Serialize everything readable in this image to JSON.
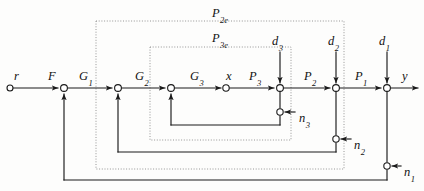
{
  "figure": {
    "type": "control-system-block-diagram",
    "title": "",
    "width": 424,
    "height": 191,
    "background_color": "#fdfdfc",
    "line_color": "#1a1a1a",
    "dotted_box_color": "#8a8a8a"
  },
  "signals": {
    "reference_input": {
      "base": "r",
      "sub": "",
      "x": 14,
      "y": 70
    },
    "output": {
      "base": "y",
      "sub": "",
      "x": 402,
      "y": 70
    },
    "intermediate": {
      "base": "x",
      "sub": "",
      "x": 226,
      "y": 70
    }
  },
  "blocks": [
    {
      "base": "F",
      "sub": "",
      "x": 48,
      "y": 70
    },
    {
      "base": "G",
      "sub": "1",
      "x": 79,
      "y": 70
    },
    {
      "base": "G",
      "sub": "2",
      "x": 135,
      "y": 70
    },
    {
      "base": "G",
      "sub": "3",
      "x": 190,
      "y": 70
    },
    {
      "base": "P",
      "sub": "3",
      "x": 249,
      "y": 70
    },
    {
      "base": "P",
      "sub": "2",
      "x": 304,
      "y": 70
    },
    {
      "base": "P",
      "sub": "1",
      "x": 355,
      "y": 70
    }
  ],
  "disturbances": [
    {
      "base": "d",
      "sub": "3",
      "x": 272,
      "y": 35,
      "inject_x": 280,
      "inject_y": 88
    },
    {
      "base": "d",
      "sub": "2",
      "x": 328,
      "y": 35,
      "inject_x": 336,
      "inject_y": 88
    },
    {
      "base": "d",
      "sub": "1",
      "x": 379,
      "y": 35,
      "inject_x": 387,
      "inject_y": 88
    }
  ],
  "noises": [
    {
      "base": "n",
      "sub": "3",
      "x": 299,
      "y": 112,
      "node_x": 280,
      "node_y": 112
    },
    {
      "base": "n",
      "sub": "2",
      "x": 354,
      "y": 139,
      "node_x": 336,
      "node_y": 139
    },
    {
      "base": "n",
      "sub": "1",
      "x": 404,
      "y": 166,
      "node_x": 387,
      "node_y": 166
    }
  ],
  "plant_boundaries": [
    {
      "base": "P",
      "sub": "2e",
      "label_x": 212,
      "label_y": 7,
      "box": {
        "x": 96,
        "y": 21,
        "width": 248,
        "height": 148
      }
    },
    {
      "base": "P",
      "sub": "3e",
      "label_x": 212,
      "label_y": 32,
      "box": {
        "x": 150,
        "y": 47,
        "width": 141,
        "height": 93
      }
    }
  ],
  "summing_junctions": [
    {
      "name": "sum-F-G1",
      "x": 64,
      "y": 88
    },
    {
      "name": "sum-G1-G2",
      "x": 118,
      "y": 88
    },
    {
      "name": "sum-G2-G3",
      "x": 171,
      "y": 88
    },
    {
      "name": "sum-P3-d3",
      "x": 280,
      "y": 88
    },
    {
      "name": "sum-P2-d2",
      "x": 336,
      "y": 88
    },
    {
      "name": "sum-P1-d1",
      "x": 387,
      "y": 88
    }
  ],
  "feedback_loops": [
    {
      "name": "inner-loop-3",
      "from_x": 280,
      "to_x": 171,
      "rail_y": 125
    },
    {
      "name": "middle-loop-2",
      "from_x": 336,
      "to_x": 118,
      "rail_y": 152
    },
    {
      "name": "outer-loop-1",
      "from_x": 387,
      "to_x": 64,
      "rail_y": 180
    }
  ],
  "pickoff_points": [
    {
      "name": "pickoff-x",
      "x": 226,
      "y": 88
    }
  ]
}
